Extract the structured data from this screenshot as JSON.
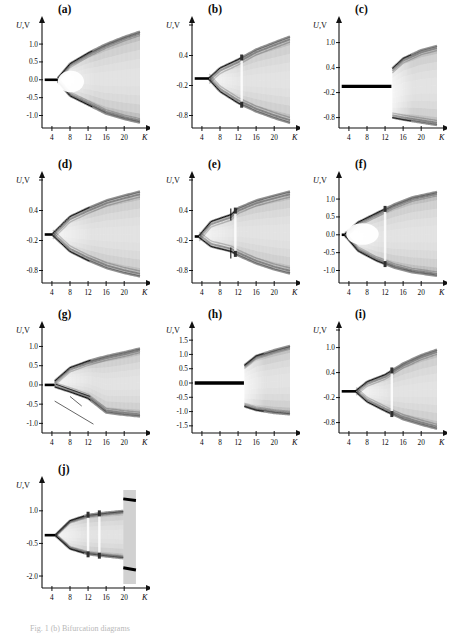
{
  "figure": {
    "axis_y_label": "U,",
    "axis_y_unit": "V",
    "axis_x_label": "K",
    "caption": "Fig. 1 (b) Bifurcation diagrams"
  },
  "chart_data": [
    {
      "id": "a",
      "type": "scatter",
      "title": "(a)",
      "xlabel": "K",
      "ylabel": "U, V",
      "xlim": [
        1.8,
        23.5
      ],
      "ylim": [
        -1.35,
        1.45
      ],
      "xticks": [
        4,
        8,
        12,
        16,
        20
      ],
      "yticks": [
        1.0,
        0.5,
        0.0,
        -0.5,
        -1.0
      ],
      "ytick_labels": [
        "1.0",
        "0.5",
        "0.0",
        "-0.5",
        "-1.0"
      ],
      "branch_onset": 5.3,
      "fixed_point": 0.0,
      "description": "Period-doubling to chaos, wide dark band from K=5.3, bubble-shaped white region 5.5-11",
      "envelope_upper": [
        [
          5.3,
          0.05
        ],
        [
          8,
          0.45
        ],
        [
          12,
          0.75
        ],
        [
          16,
          1.0
        ],
        [
          20,
          1.2
        ],
        [
          23.5,
          1.35
        ]
      ],
      "envelope_lower": [
        [
          5.3,
          -0.05
        ],
        [
          8,
          -0.45
        ],
        [
          12,
          -0.7
        ],
        [
          16,
          -0.95
        ],
        [
          20,
          -1.1
        ],
        [
          23.5,
          -1.2
        ]
      ]
    },
    {
      "id": "b",
      "type": "scatter",
      "title": "(b)",
      "xlabel": "K",
      "ylabel": "U, V",
      "xlim": [
        1.8,
        23.5
      ],
      "ylim": [
        -1.05,
        0.95
      ],
      "xticks": [
        4,
        8,
        12,
        16,
        20
      ],
      "yticks": [
        0.4,
        -0.2,
        -0.8
      ],
      "ytick_labels": [
        "0.4",
        "-0.2",
        "-0.8"
      ],
      "branch_onset": 5.6,
      "fixed_point": -0.06,
      "description": "Pitchfork at K=5.6 into two branches, chaotic bands widening, periodic window near K=12.8",
      "envelope_upper": [
        [
          5.6,
          -0.05
        ],
        [
          8,
          0.15
        ],
        [
          12,
          0.32
        ],
        [
          16,
          0.52
        ],
        [
          20,
          0.66
        ],
        [
          23.5,
          0.78
        ]
      ],
      "envelope_lower": [
        [
          5.6,
          -0.08
        ],
        [
          8,
          -0.32
        ],
        [
          12,
          -0.55
        ],
        [
          16,
          -0.72
        ],
        [
          20,
          -0.85
        ],
        [
          23.5,
          -0.95
        ]
      ]
    },
    {
      "id": "c",
      "type": "scatter",
      "title": "(c)",
      "xlabel": "K",
      "ylabel": "U, V",
      "xlim": [
        1.8,
        23.5
      ],
      "ylim": [
        -1.05,
        1.35
      ],
      "xticks": [
        4,
        8,
        12,
        16,
        20
      ],
      "yticks": [
        1.0,
        0.4,
        -0.2,
        -0.8
      ],
      "ytick_labels": [
        "1.0",
        "0.4",
        "-0.2",
        "-0.8"
      ],
      "branch_onset": 13.4,
      "fixed_point": -0.05,
      "description": "Stable fixed point until K=13.4, then abrupt jump to two separated bands",
      "envelope_upper": [
        [
          13.6,
          0.38
        ],
        [
          16,
          0.62
        ],
        [
          20,
          0.82
        ],
        [
          23.5,
          0.92
        ]
      ],
      "envelope_lower": [
        [
          13.6,
          -0.8
        ],
        [
          16,
          -0.85
        ],
        [
          20,
          -0.92
        ],
        [
          23.5,
          -0.98
        ]
      ]
    },
    {
      "id": "d",
      "type": "scatter",
      "title": "(d)",
      "xlabel": "K",
      "ylabel": "U, V",
      "xlim": [
        1.8,
        23.5
      ],
      "ylim": [
        -1.05,
        0.95
      ],
      "xticks": [
        4,
        8,
        12,
        16,
        20
      ],
      "yticks": [
        0.4,
        -0.2,
        -0.8
      ],
      "ytick_labels": [
        "0.4",
        "-0.2",
        "-0.8"
      ],
      "branch_onset": 4.2,
      "fixed_point": -0.08,
      "description": "Smooth pitchfork at K=4.2, both branches broaden into diffuse chaotic bands",
      "envelope_upper": [
        [
          4.2,
          -0.06
        ],
        [
          8,
          0.28
        ],
        [
          12,
          0.45
        ],
        [
          16,
          0.6
        ],
        [
          20,
          0.7
        ],
        [
          23.5,
          0.78
        ]
      ],
      "envelope_lower": [
        [
          4.2,
          -0.1
        ],
        [
          8,
          -0.42
        ],
        [
          12,
          -0.6
        ],
        [
          16,
          -0.75
        ],
        [
          20,
          -0.85
        ],
        [
          23.5,
          -0.92
        ]
      ]
    },
    {
      "id": "e",
      "type": "scatter",
      "title": "(e)",
      "xlabel": "K",
      "ylabel": "U, V",
      "xlim": [
        1.8,
        23.5
      ],
      "ylim": [
        -1.05,
        0.95
      ],
      "xticks": [
        4,
        8,
        12,
        16,
        20
      ],
      "yticks": [
        0.4,
        -0.2,
        -0.8
      ],
      "ytick_labels": [
        "0.4",
        "-0.2",
        "-0.8"
      ],
      "branch_onset": 3.4,
      "fixed_point": -0.12,
      "description": "Early pitchfork at K=3.4 with thin sharp branches, secondary bifurcation near K=10.5, chaos after K=12",
      "envelope_upper": [
        [
          3.4,
          -0.1
        ],
        [
          6,
          0.18
        ],
        [
          10.5,
          0.32
        ],
        [
          12,
          0.45
        ],
        [
          16,
          0.6
        ],
        [
          20,
          0.7
        ],
        [
          23.5,
          0.78
        ]
      ],
      "envelope_lower": [
        [
          3.4,
          -0.14
        ],
        [
          6,
          -0.32
        ],
        [
          10.5,
          -0.42
        ],
        [
          12,
          -0.5
        ],
        [
          16,
          -0.66
        ],
        [
          20,
          -0.78
        ],
        [
          23.5,
          -0.86
        ]
      ]
    },
    {
      "id": "f",
      "type": "scatter",
      "title": "(f)",
      "xlabel": "K",
      "ylabel": "U, V",
      "xlim": [
        1.8,
        23.5
      ],
      "ylim": [
        -1.35,
        1.45
      ],
      "xticks": [
        4,
        8,
        12,
        16,
        20
      ],
      "yticks": [
        1.0,
        0.5,
        0.0,
        -0.5,
        -1.0
      ],
      "ytick_labels": [
        "1.0",
        "0.5",
        "0.0",
        "-0.5",
        "-1.0"
      ],
      "branch_onset": 3.1,
      "fixed_point": 0.0,
      "description": "Pitchfork at K=3.1, crisp outer branches with inner white bubble, vertical periodic window at K=12",
      "envelope_upper": [
        [
          3.1,
          0.02
        ],
        [
          6,
          0.35
        ],
        [
          10,
          0.6
        ],
        [
          14,
          0.85
        ],
        [
          18,
          1.05
        ],
        [
          23.5,
          1.2
        ]
      ],
      "envelope_lower": [
        [
          3.1,
          -0.02
        ],
        [
          6,
          -0.45
        ],
        [
          10,
          -0.72
        ],
        [
          14,
          -0.92
        ],
        [
          18,
          -1.05
        ],
        [
          23.5,
          -1.15
        ]
      ]
    },
    {
      "id": "g",
      "type": "scatter",
      "title": "(g)",
      "xlabel": "K",
      "ylabel": "U, V",
      "xlim": [
        1.8,
        23.5
      ],
      "ylim": [
        -1.25,
        1.35
      ],
      "xticks": [
        4,
        8,
        12,
        16,
        20
      ],
      "yticks": [
        1.0,
        0.5,
        0.0,
        -0.5,
        -1.0
      ],
      "ytick_labels": [
        "1.0",
        "0.5",
        "0.0",
        "-0.5",
        "-1.0"
      ],
      "branch_onset": 4.6,
      "fixed_point": 0.0,
      "description": "Asymmetric cascade from K=4.6 with additional descending transient line, broad chaos after K=13",
      "envelope_upper": [
        [
          4.6,
          0.1
        ],
        [
          8,
          0.45
        ],
        [
          12,
          0.62
        ],
        [
          16,
          0.75
        ],
        [
          20,
          0.85
        ],
        [
          23.5,
          0.95
        ]
      ],
      "envelope_lower": [
        [
          4.6,
          -0.05
        ],
        [
          8,
          -0.18
        ],
        [
          12,
          -0.35
        ],
        [
          16,
          -0.72
        ],
        [
          20,
          -0.78
        ],
        [
          23.5,
          -0.82
        ]
      ]
    },
    {
      "id": "h",
      "type": "scatter",
      "title": "(h)",
      "xlabel": "K",
      "ylabel": "U, V",
      "xlim": [
        1.8,
        23.5
      ],
      "ylim": [
        -1.75,
        1.75
      ],
      "xticks": [
        4,
        8,
        12,
        16,
        20
      ],
      "yticks": [
        1.5,
        1.0,
        0.5,
        0.0,
        -0.5,
        -1.0,
        -1.5
      ],
      "ytick_labels": [
        "1.5",
        "1.0",
        "0.5",
        "0.0",
        "-0.5",
        "-1.0",
        "-1.5"
      ],
      "branch_onset": 13.3,
      "fixed_point": 0.0,
      "description": "Thick stable fixed line at 0 until K=13.3, then sudden large-amplitude chaos",
      "envelope_upper": [
        [
          13.4,
          0.62
        ],
        [
          16,
          0.95
        ],
        [
          20,
          1.15
        ],
        [
          23.5,
          1.3
        ]
      ],
      "envelope_lower": [
        [
          13.4,
          -0.82
        ],
        [
          16,
          -0.95
        ],
        [
          20,
          -1.05
        ],
        [
          23.5,
          -1.1
        ]
      ]
    },
    {
      "id": "i",
      "type": "scatter",
      "title": "(i)",
      "xlabel": "K",
      "ylabel": "U, V",
      "xlim": [
        1.8,
        23.5
      ],
      "ylim": [
        -1.05,
        1.35
      ],
      "xticks": [
        4,
        8,
        12,
        16,
        20
      ],
      "yticks": [
        1.0,
        0.4,
        -0.2,
        -0.8
      ],
      "ytick_labels": [
        "1.0",
        "0.4",
        "-0.2",
        "-0.8"
      ],
      "branch_onset": 5.6,
      "fixed_point": -0.05,
      "description": "Pitchfork at K=5.6, chaotic bands widen, sharp periodic window near K=13.5",
      "envelope_upper": [
        [
          5.6,
          -0.03
        ],
        [
          8,
          0.18
        ],
        [
          12,
          0.35
        ],
        [
          16,
          0.62
        ],
        [
          20,
          0.82
        ],
        [
          23.5,
          0.95
        ]
      ],
      "envelope_lower": [
        [
          5.6,
          -0.07
        ],
        [
          8,
          -0.3
        ],
        [
          12,
          -0.52
        ],
        [
          16,
          -0.72
        ],
        [
          20,
          -0.85
        ],
        [
          23.5,
          -0.95
        ]
      ]
    },
    {
      "id": "j",
      "type": "scatter",
      "title": "(j)",
      "xlabel": "K",
      "ylabel": "U, V",
      "xlim": [
        1.8,
        23.5
      ],
      "ylim": [
        -2.55,
        2.05
      ],
      "xticks": [
        4,
        8,
        12,
        16,
        20
      ],
      "yticks": [
        1.0,
        -0.5,
        -2.0
      ],
      "ytick_labels": [
        "1.0",
        "-0.5",
        "-2.0"
      ],
      "branch_onset": 4.8,
      "fixed_point": -0.12,
      "description": "Clean two-branch pitchfork at K=4.8, narrow noisy windows at K=12 and K=14.5, full-height chaotic band from K=19.8",
      "envelope_upper": [
        [
          4.8,
          -0.1
        ],
        [
          8,
          0.55
        ],
        [
          12,
          0.82
        ],
        [
          16,
          0.92
        ],
        [
          19.8,
          1.0
        ]
      ],
      "envelope_lower": [
        [
          4.8,
          -0.15
        ],
        [
          8,
          -0.75
        ],
        [
          12,
          -1.0
        ],
        [
          16,
          -1.1
        ],
        [
          19.8,
          -1.18
        ]
      ]
    }
  ]
}
